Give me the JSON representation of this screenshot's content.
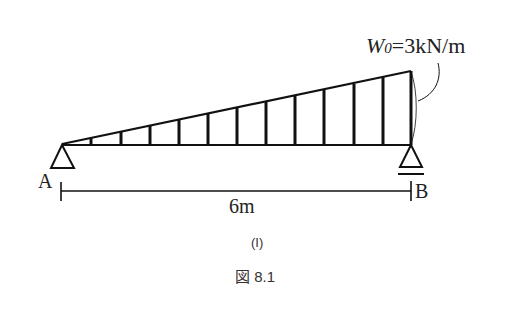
{
  "diagram": {
    "load_label_var": "W",
    "load_label_sub": "0",
    "load_label_value": "=3kN/m",
    "support_a_label": "A",
    "support_b_label": "B",
    "span_label": "6m",
    "subfigure_label": "(I)",
    "figure_caption": "図 8.1",
    "load_type": "triangular distributed load, increasing from A to B",
    "support_a_type": "pin",
    "support_b_type": "roller",
    "span_m": 6,
    "max_load_kN_per_m": 3
  },
  "colors": {
    "line": "#111111",
    "text": "#222222",
    "caption": "#333333"
  }
}
